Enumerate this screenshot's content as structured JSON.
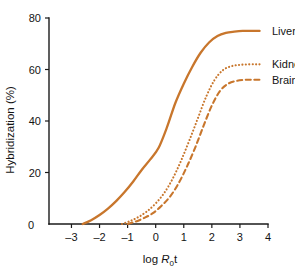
{
  "chart_data": {
    "type": "line",
    "title": "",
    "xlabel": "log R0t",
    "xlabel_parts": {
      "lead": "log ",
      "italic": "R",
      "subscript": "0",
      "trail": "t"
    },
    "ylabel": "Hybridization (%)",
    "xlim": [
      -3.8,
      4.0
    ],
    "ylim": [
      0,
      80
    ],
    "xticks": [
      -3,
      -2,
      -1,
      0,
      1,
      2,
      3,
      4
    ],
    "xtick_labels": [
      "-3",
      "-2",
      "-1",
      "0",
      "1",
      "2",
      "3",
      "4"
    ],
    "yticks": [
      0,
      20,
      40,
      60,
      80
    ],
    "ytick_labels": [
      "0",
      "20",
      "40",
      "60",
      "80"
    ],
    "origin_label": "0",
    "grid": false,
    "legend_position": "right-inline",
    "accent_color": "#c8762c",
    "axis_color": "#1a1a1a",
    "background": "#ffffff",
    "series": [
      {
        "name": "Liver",
        "label": "Liver",
        "style": "solid",
        "color": "#c8762c",
        "plateau": 75,
        "onset_x": -2.6,
        "midpoint_x": 0.6,
        "x": [
          -2.6,
          -2.3,
          -2.0,
          -1.7,
          -1.4,
          -1.1,
          -0.8,
          -0.5,
          -0.2,
          0.1,
          0.4,
          0.7,
          1.0,
          1.3,
          1.6,
          1.9,
          2.2,
          2.5,
          2.8,
          3.1,
          3.4,
          3.7
        ],
        "values": [
          0,
          1.5,
          3.5,
          6.0,
          9.0,
          12.5,
          16.5,
          21.0,
          25.0,
          29.5,
          37.5,
          47.0,
          54.5,
          61.0,
          66.5,
          70.5,
          73.0,
          74.2,
          74.7,
          75.0,
          75.0,
          75.0
        ]
      },
      {
        "name": "Kidney",
        "label": "Kidney",
        "style": "dotted",
        "color": "#c8762c",
        "plateau": 62,
        "onset_x": -1.2,
        "midpoint_x": 1.2,
        "x": [
          -1.2,
          -0.9,
          -0.6,
          -0.3,
          0.0,
          0.3,
          0.6,
          0.9,
          1.2,
          1.5,
          1.8,
          2.1,
          2.4,
          2.7,
          3.0,
          3.3,
          3.6,
          3.8
        ],
        "values": [
          0,
          1.2,
          2.8,
          5.0,
          8.0,
          12.0,
          17.5,
          24.5,
          32.5,
          41.0,
          49.5,
          56.0,
          59.8,
          61.3,
          61.8,
          62.0,
          62.0,
          62.0
        ]
      },
      {
        "name": "Brain",
        "label": "Brain",
        "style": "dashed",
        "color": "#c8762c",
        "plateau": 56,
        "onset_x": -1.0,
        "midpoint_x": 1.45,
        "x": [
          -1.0,
          -0.7,
          -0.4,
          -0.1,
          0.2,
          0.5,
          0.8,
          1.1,
          1.4,
          1.7,
          2.0,
          2.3,
          2.6,
          2.9,
          3.2,
          3.5,
          3.8
        ],
        "values": [
          0,
          1.0,
          2.4,
          4.2,
          7.0,
          10.5,
          15.5,
          22.0,
          29.5,
          38.0,
          46.0,
          51.8,
          54.6,
          55.6,
          56.0,
          56.0,
          56.0
        ]
      }
    ]
  },
  "legend": {
    "items": [
      {
        "label": "Liver",
        "style": "solid"
      },
      {
        "label": "Kidney",
        "style": "dotted"
      },
      {
        "label": "Brain",
        "style": "dashed"
      }
    ]
  }
}
